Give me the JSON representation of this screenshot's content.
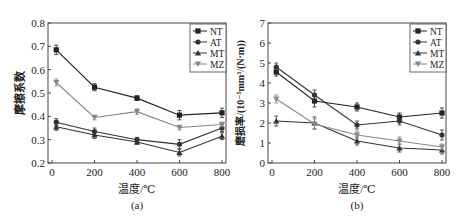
{
  "chart_data": [
    {
      "type": "line",
      "panel_label": "(a)",
      "title": "",
      "xlabel": "温度/℃",
      "ylabel": "摩擦系数",
      "x": [
        20,
        200,
        400,
        600,
        800
      ],
      "xticks": [
        "0",
        "200",
        "400",
        "600",
        "800"
      ],
      "xlim": [
        0,
        800
      ],
      "yticks": [
        "0.2",
        "0.3",
        "0.4",
        "0.5",
        "0.6",
        "0.7",
        "0.8"
      ],
      "ylim": [
        0.2,
        0.8
      ],
      "grid": false,
      "legend_position": "upper right",
      "error_bars": true,
      "series": [
        {
          "name": "NT",
          "marker": "square",
          "color": "#222222",
          "values": [
            0.685,
            0.525,
            0.478,
            0.405,
            0.415
          ],
          "errors": [
            0.02,
            0.015,
            0.01,
            0.02,
            0.02
          ]
        },
        {
          "name": "AT",
          "marker": "circle",
          "color": "#333333",
          "values": [
            0.375,
            0.335,
            0.3,
            0.28,
            0.35
          ],
          "errors": [
            0.015,
            0.015,
            0.01,
            0.02,
            0.015
          ]
        },
        {
          "name": "MT",
          "marker": "triangle-up",
          "color": "#333333",
          "values": [
            0.355,
            0.32,
            0.29,
            0.245,
            0.315
          ],
          "errors": [
            0.015,
            0.015,
            0.01,
            0.015,
            0.015
          ]
        },
        {
          "name": "MZ",
          "marker": "triangle-down",
          "color": "#888888",
          "values": [
            0.545,
            0.395,
            0.42,
            0.352,
            0.365
          ],
          "errors": [
            0.015,
            0.01,
            0.012,
            0.01,
            0.01
          ]
        }
      ]
    },
    {
      "type": "line",
      "panel_label": "(b)",
      "title": "",
      "xlabel": "温度/℃",
      "ylabel": "磨损率/(10⁻⁵mm³/(N·m))",
      "x": [
        20,
        200,
        400,
        600,
        800
      ],
      "xticks": [
        "0",
        "200",
        "400",
        "600",
        "800"
      ],
      "xlim": [
        0,
        800
      ],
      "yticks": [
        "0",
        "1",
        "2",
        "3",
        "4",
        "5",
        "6",
        "7"
      ],
      "ylim": [
        0,
        7
      ],
      "grid": false,
      "legend_position": "upper right",
      "error_bars": true,
      "series": [
        {
          "name": "NT",
          "marker": "square",
          "color": "#222222",
          "values": [
            4.55,
            3.1,
            2.8,
            2.3,
            2.5
          ],
          "errors": [
            0.2,
            0.3,
            0.2,
            0.2,
            0.25
          ]
        },
        {
          "name": "AT",
          "marker": "circle",
          "color": "#333333",
          "values": [
            4.8,
            3.4,
            1.9,
            2.1,
            1.4
          ],
          "errors": [
            0.2,
            0.25,
            0.2,
            0.2,
            0.25
          ]
        },
        {
          "name": "MT",
          "marker": "triangle-up",
          "color": "#333333",
          "values": [
            2.1,
            2.0,
            1.1,
            0.75,
            0.65
          ],
          "errors": [
            0.25,
            0.3,
            0.2,
            0.2,
            0.2
          ]
        },
        {
          "name": "MZ",
          "marker": "triangle-down",
          "color": "#888888",
          "values": [
            3.2,
            1.95,
            1.4,
            1.1,
            0.8
          ],
          "errors": [
            0.2,
            0.25,
            0.2,
            0.2,
            0.15
          ]
        }
      ]
    }
  ]
}
